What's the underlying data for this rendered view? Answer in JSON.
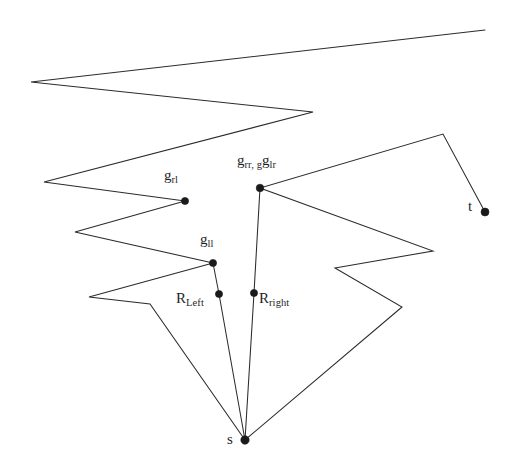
{
  "figure": {
    "width": 513,
    "height": 463,
    "background_color": "#ffffff",
    "stroke_color": "#2b2b2b",
    "label_color": "#1f1f1f",
    "dot_color": "#1a1a1a"
  },
  "labels": {
    "g_rl": {
      "base": "g",
      "sub": "rl",
      "x": 164,
      "y": 168
    },
    "g_rr_g_lr": {
      "base": "g",
      "sub": "rr, g",
      "sub2": "lr",
      "x": 237,
      "y": 153
    },
    "g_ll": {
      "base": "g",
      "sub": "ll",
      "x": 200,
      "y": 232
    },
    "R_Left": {
      "base": "R",
      "sub": "Left",
      "x": 176,
      "y": 291
    },
    "R_right": {
      "base": "R",
      "sub": "right",
      "x": 259,
      "y": 291
    },
    "s": {
      "base": "s",
      "sub": "",
      "x": 227,
      "y": 432
    },
    "t": {
      "base": "t",
      "sub": "",
      "x": 468,
      "y": 199
    }
  },
  "nodes": [
    {
      "name": "g-rl",
      "label": "g_rl",
      "x": 185,
      "y": 201,
      "r": 3.6
    },
    {
      "name": "g-rr-g-lr",
      "label": "g_rr, g_lr",
      "x": 260,
      "y": 188,
      "r": 3.8
    },
    {
      "name": "g-ll",
      "label": "g_ll",
      "x": 213,
      "y": 263,
      "r": 3.6
    },
    {
      "name": "R-Left",
      "label": "R_Left",
      "x": 219,
      "y": 294,
      "r": 3.6
    },
    {
      "name": "R-right",
      "label": "R_right",
      "x": 254,
      "y": 293,
      "r": 3.6
    },
    {
      "name": "s",
      "label": "s",
      "x": 245,
      "y": 440,
      "r": 4.2
    },
    {
      "name": "t",
      "label": "t",
      "x": 485,
      "y": 212,
      "r": 4.0
    }
  ],
  "polygon_outline": {
    "name": "polygon-boundary",
    "points": "485,30 31,82 313,112 44,182 185,201 75,232 213,263 89,297 150,304 245,440 402,307 335,268 433,251 260,188 443,134 485,212"
  },
  "inner_path": {
    "name": "shortest-path-funnel",
    "segments": [
      {
        "name": "segment-gll-rleft",
        "points": "213,263 219,294"
      },
      {
        "name": "segment-rleft-s",
        "points": "219,294 245,440"
      },
      {
        "name": "segment-grr-rright",
        "points": "260,188 254,293"
      },
      {
        "name": "segment-rright-s",
        "points": "254,293 245,440"
      }
    ]
  }
}
